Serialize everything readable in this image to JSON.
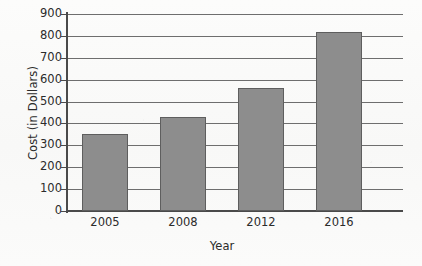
{
  "chart_data": {
    "type": "bar",
    "title": "",
    "xlabel": "Year",
    "ylabel": "Cost (in Dollars)",
    "categories": [
      "2005",
      "2008",
      "2012",
      "2016"
    ],
    "values": [
      350,
      430,
      560,
      820
    ],
    "ylim": [
      0,
      900
    ],
    "ytick_step": 100,
    "yticks": [
      900,
      800,
      700,
      600,
      500,
      400,
      300,
      200,
      100,
      0
    ],
    "ytick_labels": [
      "900",
      "800",
      "700",
      "600",
      "500",
      "400",
      "300",
      "200",
      "100",
      "0"
    ],
    "grid": true,
    "grid_axis": "y",
    "legend": false,
    "legend_position": "none",
    "series": [
      {
        "name": "Cost",
        "values": [
          350,
          430,
          560,
          820
        ]
      }
    ],
    "colors": {
      "bar_fill": "#8d8d8d",
      "bar_edge": "#5e5e5e",
      "gridline": "#6e6e6e",
      "axis": "#4a4a4a",
      "text": "#2b2b2b",
      "background": "#fbfbfa"
    }
  }
}
